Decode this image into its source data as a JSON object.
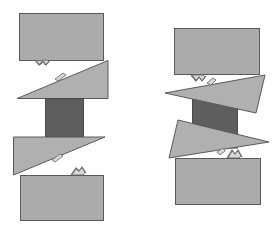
{
  "diagram": {
    "title": "",
    "assemblies": [
      {
        "name": "aligned-assembly",
        "state": "aligned",
        "parts": [
          "top-block",
          "upper-wedge",
          "core-block",
          "lower-wedge",
          "bottom-block"
        ],
        "contacts": [
          "top-block/upper-wedge",
          "lower-wedge/bottom-block"
        ]
      },
      {
        "name": "tilted-assembly",
        "state": "tilted",
        "parts": [
          "top-block",
          "upper-wedge",
          "core-block",
          "lower-wedge",
          "bottom-block"
        ],
        "contacts": [
          "top-block/upper-wedge",
          "lower-wedge/bottom-block"
        ]
      }
    ],
    "colors": {
      "block": "#ababab",
      "wedge": "#b0b0b0",
      "core": "#5e5e5e",
      "outline": "#5a5a5a",
      "background": "#ffffff"
    },
    "labels": []
  }
}
